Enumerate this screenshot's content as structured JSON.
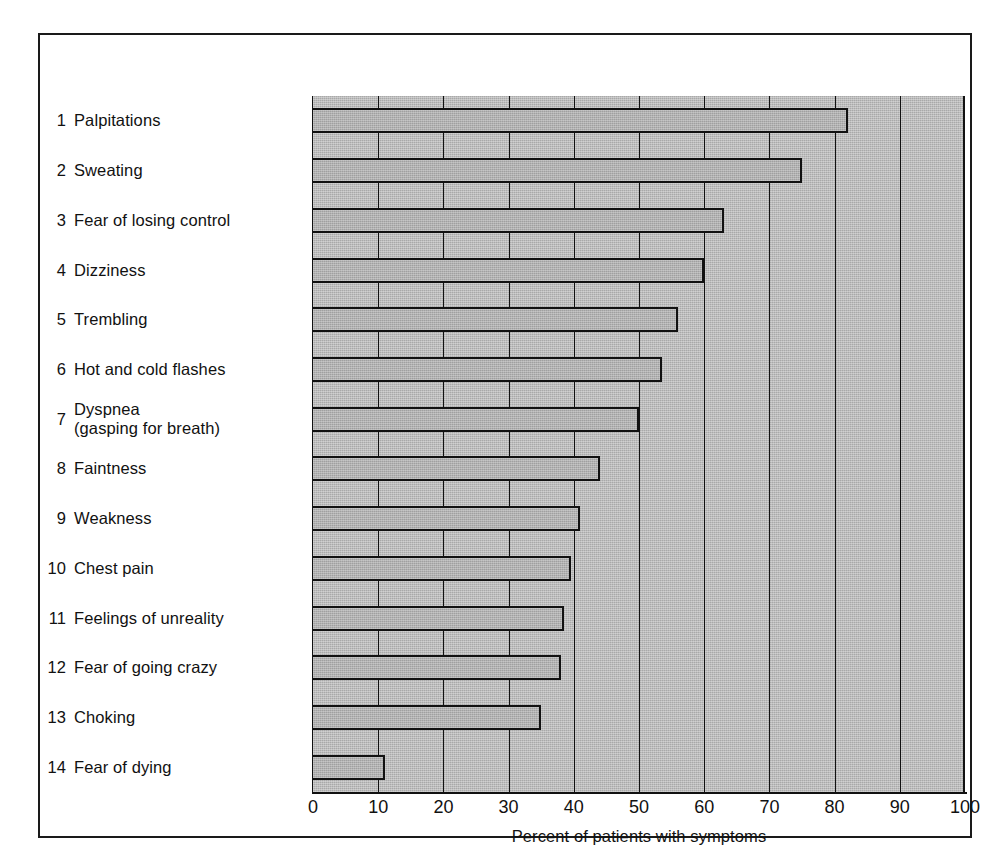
{
  "figure": {
    "frame_color": "#1a1a1a",
    "plot_bg_color": "#a9a9a9",
    "bar_fill_color": "#a0a0a0",
    "bar_edge_color": "#111111"
  },
  "chart_data": {
    "type": "bar",
    "orientation": "horizontal",
    "title": "",
    "subtitle": "",
    "xlabel": "Percent of patients with symptoms",
    "ylabel": "",
    "xlim": [
      0,
      100
    ],
    "xticks": [
      "0",
      "10",
      "20",
      "30",
      "40",
      "50",
      "60",
      "70",
      "80",
      "90",
      "100"
    ],
    "xtick_values": [
      0,
      10,
      20,
      30,
      40,
      50,
      60,
      70,
      80,
      90,
      100
    ],
    "grid": "vertical",
    "legend": "none",
    "categories": [
      "Palpitations",
      "Sweating",
      "Fear of losing control",
      "Dizziness",
      "Trembling",
      "Hot and cold flashes",
      "Dyspnea\n(gasping for breath)",
      "Faintness",
      "Weakness",
      "Chest pain",
      "Feelings of unreality",
      "Fear of going crazy",
      "Choking",
      "Fear of dying"
    ],
    "values": [
      82,
      75,
      63,
      60,
      56,
      53.5,
      50,
      44,
      41,
      39.5,
      38.5,
      38,
      35,
      11
    ]
  },
  "rows": [
    {
      "num": "1",
      "label": "Palpitations",
      "label_line2": "",
      "value": 82
    },
    {
      "num": "2",
      "label": "Sweating",
      "label_line2": "",
      "value": 75
    },
    {
      "num": "3",
      "label": "Fear of losing control",
      "label_line2": "",
      "value": 63
    },
    {
      "num": "4",
      "label": "Dizziness",
      "label_line2": "",
      "value": 60
    },
    {
      "num": "5",
      "label": "Trembling",
      "label_line2": "",
      "value": 56
    },
    {
      "num": "6",
      "label": "Hot and cold flashes",
      "label_line2": "",
      "value": 53.5
    },
    {
      "num": "7",
      "label": "Dyspnea",
      "label_line2": "(gasping for breath)",
      "value": 50
    },
    {
      "num": "8",
      "label": "Faintness",
      "label_line2": "",
      "value": 44
    },
    {
      "num": "9",
      "label": "Weakness",
      "label_line2": "",
      "value": 41
    },
    {
      "num": "10",
      "label": "Chest pain",
      "label_line2": "",
      "value": 39.5
    },
    {
      "num": "11",
      "label": "Feelings of unreality",
      "label_line2": "",
      "value": 38.5
    },
    {
      "num": "12",
      "label": "Fear of going crazy",
      "label_line2": "",
      "value": 38
    },
    {
      "num": "13",
      "label": "Choking",
      "label_line2": "",
      "value": 35
    },
    {
      "num": "14",
      "label": "Fear of dying",
      "label_line2": "",
      "value": 11
    }
  ],
  "xaxis": {
    "title": "Percent of patients with symptoms",
    "ticks": [
      "0",
      "10",
      "20",
      "30",
      "40",
      "50",
      "60",
      "70",
      "80",
      "90",
      "100"
    ]
  }
}
